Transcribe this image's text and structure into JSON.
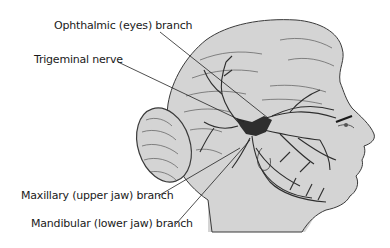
{
  "diagram": {
    "colors": {
      "skin": "#d4d4d4",
      "outline": "#3a3a3a",
      "nerve": "#2e2e2e",
      "leader": "#222222",
      "text": "#1a1a1a"
    },
    "labels": [
      {
        "id": "ophthalmic",
        "text": "Ophthalmic (eyes) branch"
      },
      {
        "id": "trigeminal",
        "text": "Trigeminal nerve"
      },
      {
        "id": "maxillary",
        "text": "Maxillary (upper jaw) branch"
      },
      {
        "id": "mandibular",
        "text": "Mandibular (lower jaw) branch"
      }
    ]
  }
}
